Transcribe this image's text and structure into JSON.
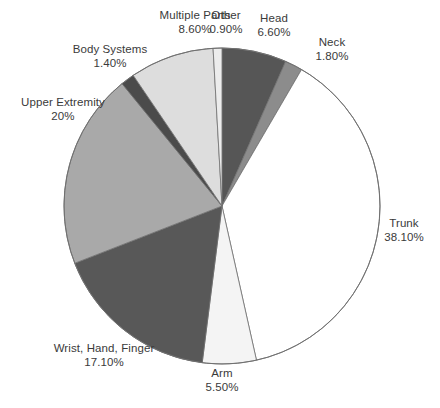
{
  "chart_data": {
    "type": "pie",
    "title": "",
    "subtitle": "",
    "xlabel": "",
    "ylabel": "",
    "legend_position": "none",
    "grid": false,
    "start_angle_deg": 0,
    "direction": "clockwise",
    "categories": [
      "Head",
      "Neck",
      "Trunk",
      "Arm",
      "Wrist, Hand, Finger",
      "Upper Extremity",
      "Body Systems",
      "Multiple Parts",
      "Other"
    ],
    "values": [
      6.6,
      1.8,
      38.1,
      5.5,
      17.1,
      20.0,
      1.4,
      8.6,
      0.9
    ],
    "value_labels": [
      "6.60%",
      "1.80%",
      "38.10%",
      "5.50%",
      "17.10%",
      "20%",
      "1.40%",
      "8.60%",
      "0.90%"
    ],
    "colors": [
      "#565656",
      "#8c8c8c",
      "#ffffff",
      "#f4f4f4",
      "#585858",
      "#a9a9a9",
      "#4b4b4b",
      "#dddddd",
      "#ececec"
    ],
    "total": 100.0,
    "units": "percent",
    "slices": [
      {
        "label": "Head",
        "value": 6.6,
        "value_label": "6.60%",
        "color": "#565656"
      },
      {
        "label": "Neck",
        "value": 1.8,
        "value_label": "1.80%",
        "color": "#8c8c8c"
      },
      {
        "label": "Trunk",
        "value": 38.1,
        "value_label": "38.10%",
        "color": "#ffffff"
      },
      {
        "label": "Arm",
        "value": 5.5,
        "value_label": "5.50%",
        "color": "#f4f4f4"
      },
      {
        "label": "Wrist, Hand, Finger",
        "value": 17.1,
        "value_label": "17.10%",
        "color": "#585858"
      },
      {
        "label": "Upper Extremity",
        "value": 20.0,
        "value_label": "20%",
        "color": "#a9a9a9"
      },
      {
        "label": "Body Systems",
        "value": 1.4,
        "value_label": "1.40%",
        "color": "#4b4b4b"
      },
      {
        "label": "Multiple Parts",
        "value": 8.6,
        "value_label": "8.60%",
        "color": "#dddddd"
      },
      {
        "label": "Other",
        "value": 0.9,
        "value_label": "0.90%",
        "color": "#ececec"
      }
    ]
  },
  "geometry": {
    "center_x": 222,
    "center_y": 206,
    "radius": 158,
    "stroke": "#707070",
    "stroke_width": 0.8,
    "background": "#ffffff"
  },
  "labels": {
    "head": {
      "name": "Head",
      "value": "6.60%"
    },
    "neck": {
      "name": "Neck",
      "value": "1.80%"
    },
    "trunk": {
      "name": "Trunk",
      "value": "38.10%"
    },
    "arm": {
      "name": "Arm",
      "value": "5.50%"
    },
    "wrist": {
      "name": "Wrist, Hand, Finger",
      "value": "17.10%"
    },
    "upper": {
      "name": "Upper Extremity",
      "value": "20%"
    },
    "body_systems": {
      "name": "Body Systems",
      "value": "1.40%"
    },
    "multiple_parts": {
      "name": "Multiple Parts",
      "value": "8.60%"
    },
    "other": {
      "name": "Other",
      "value": "0.90%"
    }
  }
}
